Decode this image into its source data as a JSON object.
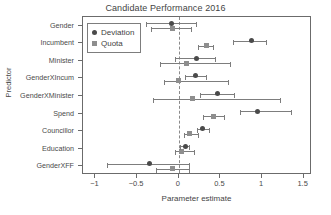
{
  "chart_data": {
    "type": "scatter",
    "title": "Candidate Performance 2016",
    "xlabel": "Parameter estimate",
    "ylabel": "Predictor",
    "xlim": [
      -1.15,
      1.6
    ],
    "xticks": [
      -1,
      -0.5,
      0,
      0.5,
      1,
      1.5
    ],
    "xtick_labels": [
      "−1",
      "−0.5",
      "0",
      "0.5",
      "1",
      "1.5"
    ],
    "grid": false,
    "zero_reference_line": 0,
    "legend_position": "top-left",
    "legend": [
      {
        "name": "Deviation",
        "marker": "circle",
        "color": "#4a4a4a"
      },
      {
        "name": "Quota",
        "marker": "square",
        "color": "#8e8e8e"
      }
    ],
    "categories": [
      "Gender",
      "Incumbent",
      "Minister",
      "GenderXIncum",
      "GenderXMinister",
      "Spend",
      "Councillor",
      "Education",
      "GenderXFF"
    ],
    "series": [
      {
        "name": "Deviation",
        "marker": "circle",
        "values": [
          -0.09,
          0.87,
          0.21,
          0.2,
          0.46,
          0.95,
          0.29,
          0.08,
          -0.35
        ],
        "ci_low": [
          -0.39,
          0.65,
          -0.04,
          0.07,
          0.26,
          0.73,
          0.22,
          0.02,
          -0.86
        ],
        "ci_high": [
          0.22,
          1.06,
          0.45,
          0.34,
          0.67,
          1.36,
          0.37,
          0.14,
          0.14
        ]
      },
      {
        "name": "Quota",
        "marker": "square",
        "values": [
          -0.07,
          0.33,
          0.09,
          0.0,
          0.17,
          0.42,
          0.13,
          0.03,
          -0.08
        ],
        "ci_low": [
          -0.33,
          0.23,
          -0.23,
          -0.18,
          -0.31,
          0.29,
          0.06,
          -0.05,
          -0.27
        ],
        "ci_high": [
          0.16,
          0.42,
          0.63,
          0.6,
          1.23,
          0.56,
          0.24,
          0.2,
          0.13
        ]
      }
    ]
  }
}
